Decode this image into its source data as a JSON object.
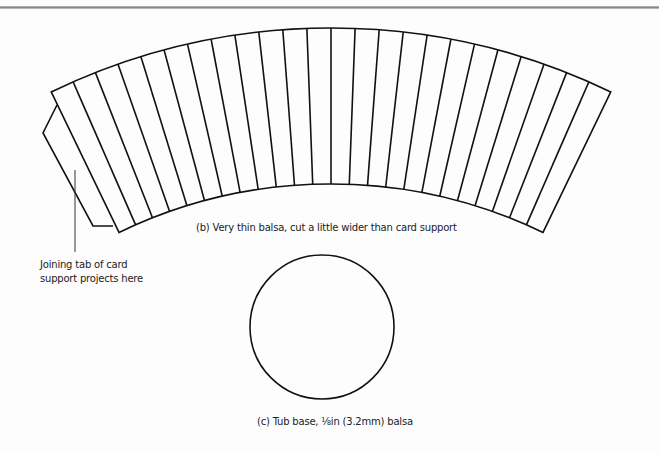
{
  "diagram": {
    "strip_piece": {
      "strip_count": 24,
      "caption": "(b) Very thin balsa, cut a little wider than card support"
    },
    "tab_note": {
      "line1": "Joining tab of card",
      "line2": "support projects here"
    },
    "base_piece": {
      "caption": "(c) Tub base, ⅛in (3.2mm) balsa"
    },
    "colors": {
      "stroke": "#111111",
      "background": "#fdfdfd"
    }
  }
}
